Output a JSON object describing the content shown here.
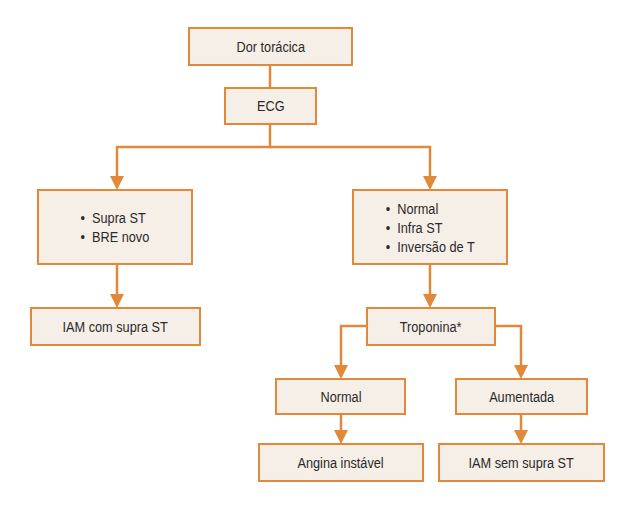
{
  "diagram": {
    "type": "flowchart",
    "colors": {
      "border": "#e2883a",
      "fill": "#f6efe7",
      "text": "#2a2a2a",
      "connector": "#e2883a"
    },
    "nodes": {
      "chest_pain": {
        "label": "Dor torácica"
      },
      "ecg": {
        "label": "ECG"
      },
      "st_elevation_group": {
        "items": [
          "Supra ST",
          "BRE novo"
        ]
      },
      "non_st_group": {
        "items": [
          "Normal",
          "Infra ST",
          "Inversão de T"
        ]
      },
      "stemi": {
        "label": "IAM com supra ST"
      },
      "troponin": {
        "label": "Troponina*"
      },
      "troponin_normal": {
        "label": "Normal"
      },
      "troponin_elevated": {
        "label": "Aumentada"
      },
      "unstable_angina": {
        "label": "Angina instável"
      },
      "nstemi": {
        "label": "IAM sem supra ST"
      }
    },
    "edges": [
      {
        "from": "chest_pain",
        "to": "ecg"
      },
      {
        "from": "ecg",
        "to": "st_elevation_group"
      },
      {
        "from": "ecg",
        "to": "non_st_group"
      },
      {
        "from": "st_elevation_group",
        "to": "stemi"
      },
      {
        "from": "non_st_group",
        "to": "troponin"
      },
      {
        "from": "troponin",
        "to": "troponin_normal"
      },
      {
        "from": "troponin",
        "to": "troponin_elevated"
      },
      {
        "from": "troponin_normal",
        "to": "unstable_angina"
      },
      {
        "from": "troponin_elevated",
        "to": "nstemi"
      }
    ]
  }
}
